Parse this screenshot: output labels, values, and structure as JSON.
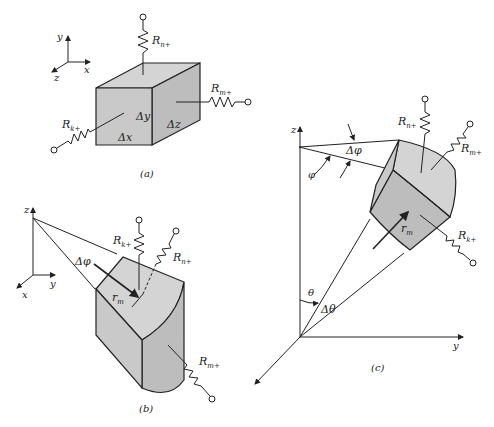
{
  "figure": {
    "panels": [
      {
        "id": "a",
        "caption": "(a)",
        "shape": "rectangular-element",
        "axes": {
          "vertical": "y",
          "horizontal": "x",
          "depth": "z"
        },
        "dimension_labels": [
          "Δy",
          "Δx",
          "Δz"
        ],
        "resistors": [
          "Rn+",
          "Rm+",
          "Rk+"
        ]
      },
      {
        "id": "b",
        "caption": "(b)",
        "shape": "cylindrical-element",
        "axes": {
          "vertical": "z",
          "horizontal": "y",
          "depth": "x"
        },
        "angle_label": "Δφ",
        "radius_label": "rm",
        "resistors": [
          "Rk+",
          "Rn+",
          "Rm+"
        ]
      },
      {
        "id": "c",
        "caption": "(c)",
        "shape": "spherical-element",
        "axes": {
          "vertical": "z",
          "horizontal": "y"
        },
        "angle_labels": [
          "Δφ",
          "φ",
          "θ",
          "Δθ"
        ],
        "radius_label": "rm",
        "resistors": [
          "Rn+",
          "Rm+",
          "Rk+"
        ]
      }
    ]
  },
  "labels": {
    "a_y": "y",
    "a_x": "x",
    "a_z": "z",
    "a_Rn": "R",
    "a_Rn_sub": "n+",
    "a_Rm": "R",
    "a_Rm_sub": "m+",
    "a_Rk": "R",
    "a_Rk_sub": "k+",
    "a_dy": "Δy",
    "a_dx": "Δx",
    "a_dz": "Δz",
    "a_cap": "(a)",
    "b_z": "z",
    "b_y": "y",
    "b_x": "x",
    "b_Rk": "R",
    "b_Rk_sub": "k+",
    "b_Rn": "R",
    "b_Rn_sub": "n+",
    "b_Rm": "R",
    "b_Rm_sub": "m+",
    "b_dphi": "Δφ",
    "b_r": "r",
    "b_r_sub": "m",
    "b_cap": "(b)",
    "c_z": "z",
    "c_y": "y",
    "c_Rn": "R",
    "c_Rn_sub": "n+",
    "c_Rm": "R",
    "c_Rm_sub": "m+",
    "c_Rk": "R",
    "c_Rk_sub": "k+",
    "c_dphi": "Δφ",
    "c_phi": "φ",
    "c_theta": "θ",
    "c_dtheta": "Δθ",
    "c_r": "r",
    "c_r_sub": "m",
    "c_cap": "(c)"
  }
}
